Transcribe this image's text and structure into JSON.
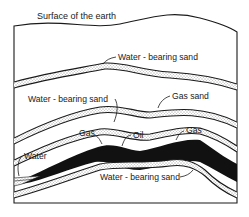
{
  "diagram": {
    "title": "Surface of the earth",
    "labels": {
      "water_sand_top": "Water - bearing sand",
      "water_sand_mid": "Water - bearing sand",
      "gas_sand": "Gas sand",
      "gas_left": "Gas",
      "oil": "Oil",
      "gas_right": "Gas",
      "water": "Water",
      "water_sand_bottom": "Water - bearing sand"
    },
    "colors": {
      "ink": "#1a1a1a",
      "oil": "#111111",
      "background": "#ffffff"
    }
  }
}
